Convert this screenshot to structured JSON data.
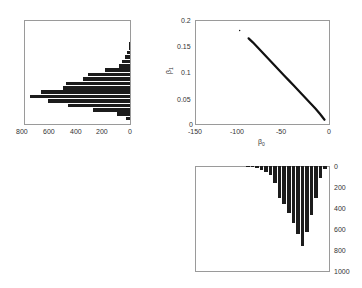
{
  "chart_data": [
    {
      "id": "left-histogram",
      "type": "bar",
      "orientation": "horizontal",
      "title": "",
      "xlabel": "",
      "ylabel": "",
      "xlim": [
        800,
        0
      ],
      "x_reversed": true,
      "xticks": [
        "800",
        "600",
        "400",
        "200",
        "0"
      ],
      "grid": false,
      "values": [
        5,
        10,
        25,
        40,
        60,
        80,
        190,
        315,
        355,
        480,
        505,
        670,
        755,
        620,
        470,
        280,
        100,
        30
      ]
    },
    {
      "id": "scatter",
      "type": "scatter",
      "title": "",
      "xlabel": "β0",
      "ylabel": "β1",
      "xlim": [
        -150,
        0
      ],
      "ylim": [
        0,
        0.2
      ],
      "xticks": [
        "-150",
        "-100",
        "-50",
        "0"
      ],
      "yticks": [
        "0",
        "0.05",
        "0.1",
        "0.15",
        "0.2"
      ],
      "grid": false,
      "points_description": "dense negative linear band from about (-90, 0.165) to (-5, 0.01), one outlier near (-100, 0.18)",
      "x": [
        -100,
        -90,
        -85,
        -80,
        -75,
        -70,
        -65,
        -60,
        -55,
        -50,
        -45,
        -40,
        -35,
        -30,
        -25,
        -20,
        -15,
        -10,
        -5
      ],
      "y": [
        0.18,
        0.165,
        0.157,
        0.148,
        0.139,
        0.13,
        0.121,
        0.112,
        0.103,
        0.094,
        0.085,
        0.076,
        0.067,
        0.058,
        0.049,
        0.04,
        0.031,
        0.021,
        0.01
      ]
    },
    {
      "id": "bottom-histogram",
      "type": "bar",
      "orientation": "vertical-down",
      "title": "",
      "xlabel": "",
      "ylabel": "",
      "ylim": [
        0,
        1000
      ],
      "y_reversed": true,
      "yticks": [
        "0",
        "200",
        "400",
        "600",
        "800",
        "1000"
      ],
      "grid": false,
      "values": [
        5,
        10,
        20,
        35,
        60,
        90,
        160,
        300,
        360,
        450,
        540,
        650,
        760,
        630,
        470,
        300,
        110,
        30
      ]
    }
  ],
  "labels": {
    "left_xticks": [
      "800",
      "600",
      "400",
      "200",
      "0"
    ],
    "scatter_xticks": [
      "-150",
      "-100",
      "-50",
      "0"
    ],
    "scatter_yticks": [
      "0.2",
      "0.15",
      "0.1",
      "0.05",
      "0"
    ],
    "scatter_xlabel": "β",
    "scatter_xlabel_sub": "0",
    "scatter_ylabel": "β",
    "scatter_ylabel_sub": "1",
    "bottom_yticks": [
      "0",
      "200",
      "400",
      "600",
      "800",
      "1000"
    ]
  }
}
